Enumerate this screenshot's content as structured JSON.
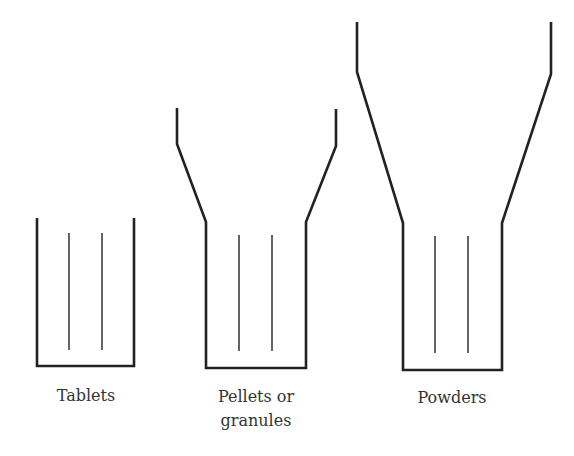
{
  "diagram": {
    "stroke_color": "#222222",
    "label_color": "#333333",
    "vessels": [
      {
        "id": "tablets",
        "label_lines": [
          "Tablets"
        ],
        "outline": "M37,218 L37,366 L134,366 L134,218",
        "inner_lines": [
          {
            "x": 69,
            "y1": 233,
            "y2": 350
          },
          {
            "x": 102,
            "y1": 233,
            "y2": 350
          }
        ],
        "label_x": 86,
        "label_y": 384
      },
      {
        "id": "pellets-or-granules",
        "label_lines": [
          "Pellets or",
          "granules"
        ],
        "outline": "M177,108 L177,144 L206,222 L206,368 L306,368 L306,222 L336,146 L336,109",
        "inner_lines": [
          {
            "x": 239,
            "y1": 235,
            "y2": 351
          },
          {
            "x": 272,
            "y1": 235,
            "y2": 351
          }
        ],
        "label_x": 256,
        "label_y": 385
      },
      {
        "id": "powders",
        "label_lines": [
          "Powders"
        ],
        "outline": "M357,22 L357,72 L403,223 L403,370 L502,370 L502,223 L551,74 L551,22",
        "inner_lines": [
          {
            "x": 435,
            "y1": 236,
            "y2": 353
          },
          {
            "x": 468,
            "y1": 236,
            "y2": 353
          }
        ],
        "label_x": 452,
        "label_y": 386
      }
    ]
  }
}
